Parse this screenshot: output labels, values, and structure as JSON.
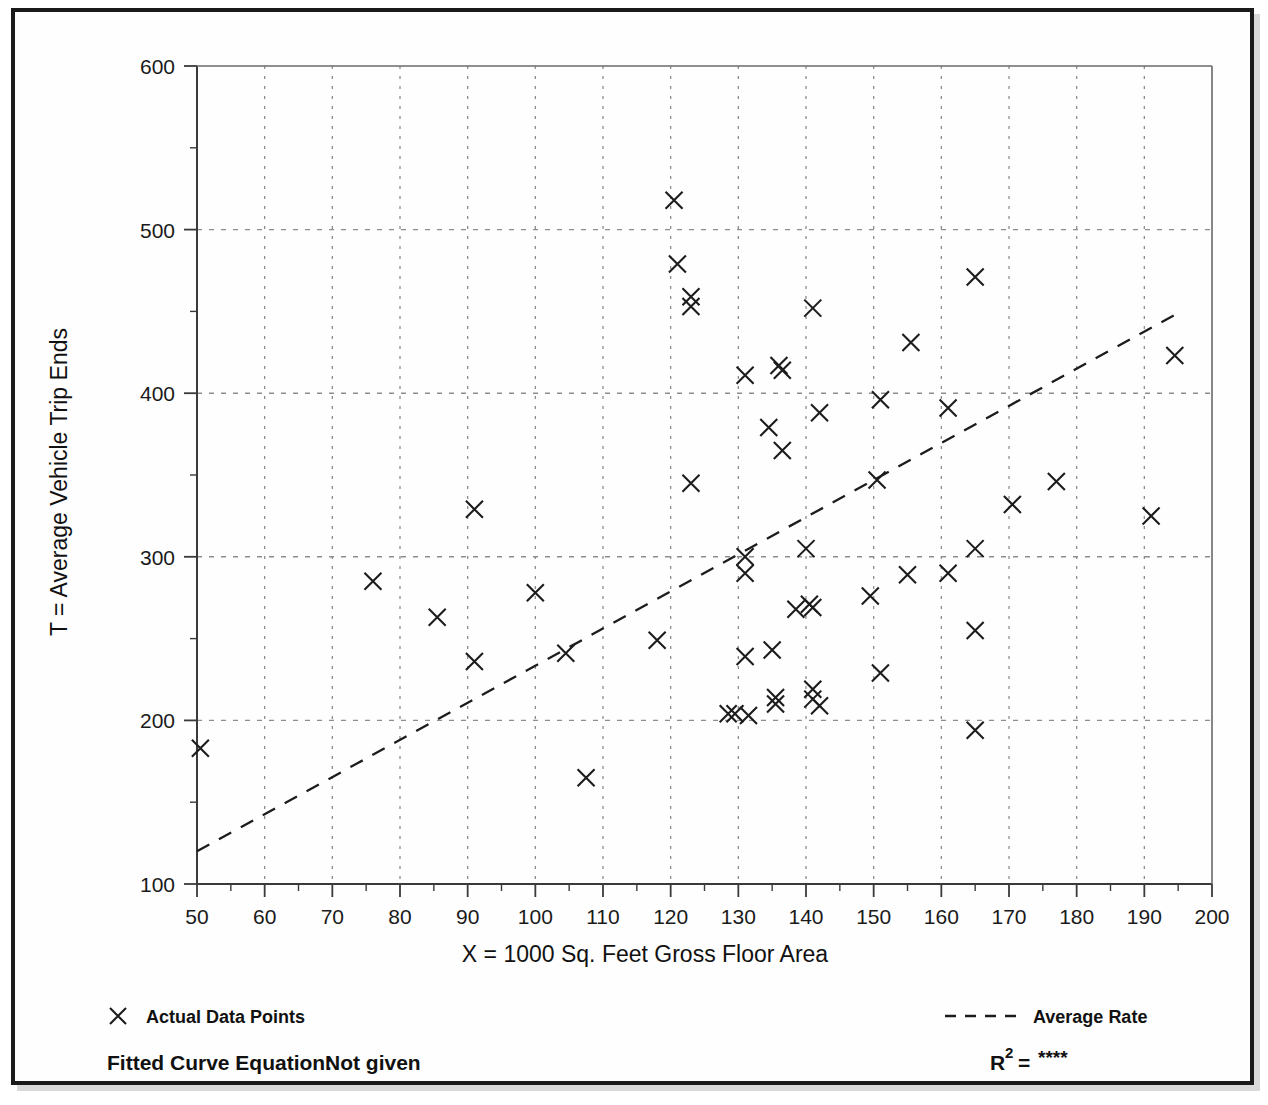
{
  "figure": {
    "title_visible_fragment": "quadratic"
  },
  "legend": {
    "data_points_label": "Actual Data Points",
    "average_rate_label": "Average Rate",
    "marker_icon": "x-marker-icon",
    "line_icon": "dashed-line-icon"
  },
  "footer": {
    "fitted_curve_label": "Fitted Curve Equation:",
    "fitted_curve_value": "Not given",
    "r2_label": "R",
    "r2_superscript": "2",
    "r2_equals": "=",
    "r2_value": "****"
  },
  "colors": {
    "ink": "#1c1c1c",
    "grid": "#8d8d8d",
    "frame": "#1a1a1a",
    "paper": "#fefefe"
  },
  "chart_data": {
    "type": "scatter",
    "title": "",
    "xlabel": "X = 1000 Sq. Feet Gross Floor Area",
    "ylabel": "T = Average Vehicle Trip Ends",
    "xlim": [
      50,
      200
    ],
    "ylim": [
      100,
      600
    ],
    "xticks": [
      50,
      60,
      70,
      80,
      90,
      100,
      110,
      120,
      130,
      140,
      150,
      160,
      170,
      180,
      190,
      200
    ],
    "yticks": [
      100,
      200,
      300,
      400,
      500,
      600
    ],
    "xtick_labels": [
      "50",
      "60",
      "70",
      "80",
      "90",
      "100",
      "110",
      "120",
      "130",
      "140",
      "150",
      "160",
      "170",
      "180",
      "190",
      "200"
    ],
    "ytick_labels": [
      "100",
      "200",
      "300",
      "400",
      "500",
      "600"
    ],
    "x_minor_step": 5,
    "y_minor_step": 50,
    "grid": true,
    "grid_style": "dotted",
    "legend_position": "below-plot",
    "marker": "x",
    "series": [
      {
        "name": "Actual Data Points",
        "marker": "x",
        "points": [
          [
            50.5,
            183
          ],
          [
            76,
            285
          ],
          [
            85.5,
            263
          ],
          [
            91,
            329
          ],
          [
            91,
            236
          ],
          [
            100,
            278
          ],
          [
            104.5,
            241
          ],
          [
            107.5,
            165
          ],
          [
            118,
            249
          ],
          [
            120.5,
            518
          ],
          [
            121,
            479
          ],
          [
            123,
            459
          ],
          [
            123,
            453
          ],
          [
            123,
            345
          ],
          [
            128.5,
            204
          ],
          [
            129.5,
            204
          ],
          [
            131,
            411
          ],
          [
            131,
            300
          ],
          [
            131,
            290
          ],
          [
            131,
            239
          ],
          [
            131.5,
            203
          ],
          [
            134.5,
            379
          ],
          [
            135,
            243
          ],
          [
            135.5,
            214
          ],
          [
            135.5,
            210
          ],
          [
            136,
            417
          ],
          [
            136.5,
            414
          ],
          [
            136.5,
            365
          ],
          [
            138.5,
            268
          ],
          [
            140,
            305
          ],
          [
            140.5,
            271
          ],
          [
            141,
            269
          ],
          [
            141,
            219
          ],
          [
            141,
            213
          ],
          [
            142,
            209
          ],
          [
            142,
            388
          ],
          [
            141,
            452
          ],
          [
            149.5,
            276
          ],
          [
            150.5,
            347
          ],
          [
            151,
            396
          ],
          [
            151,
            229
          ],
          [
            155,
            289
          ],
          [
            155.5,
            431
          ],
          [
            161,
            290
          ],
          [
            161,
            391
          ],
          [
            165,
            471
          ],
          [
            165,
            305
          ],
          [
            165,
            255
          ],
          [
            165,
            194
          ],
          [
            170.5,
            332
          ],
          [
            177,
            346
          ],
          [
            191,
            325
          ],
          [
            194.5,
            423
          ]
        ]
      }
    ],
    "trendline": {
      "name": "Average Rate",
      "style": "dashed",
      "x": [
        50,
        195
      ],
      "y": [
        120,
        449
      ]
    }
  }
}
